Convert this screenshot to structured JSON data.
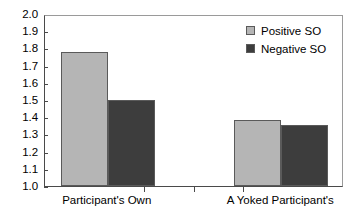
{
  "chart_data": {
    "type": "bar",
    "title": "",
    "xlabel": "",
    "ylabel": "",
    "categories": [
      "Participant's Own",
      "A Yoked Participant's"
    ],
    "series": [
      {
        "name": "Positive SO",
        "values": [
          1.78,
          1.385
        ],
        "color": "#b5b5b5"
      },
      {
        "name": "Negative SO",
        "values": [
          1.5,
          1.355
        ],
        "color": "#3d3d3d"
      }
    ],
    "ylim": [
      1.0,
      2.0
    ],
    "ytick_labels": [
      "2.0",
      "1.9",
      "1.8",
      "1.7",
      "1.6",
      "1.5",
      "1.4",
      "1.3",
      "1.2",
      "1.1",
      "1.0"
    ],
    "ytick_values": [
      2.0,
      1.9,
      1.8,
      1.7,
      1.6,
      1.5,
      1.4,
      1.3,
      1.2,
      1.1,
      1.0
    ],
    "grid": false,
    "legend_position": "upper right"
  },
  "legend": {
    "entries": [
      {
        "label": "Positive SO",
        "color": "#b5b5b5"
      },
      {
        "label": "Negative SO",
        "color": "#3d3d3d"
      }
    ]
  },
  "colors": {
    "positive_so": "#b5b5b5",
    "negative_so": "#3d3d3d",
    "axis": "#4a4a4a",
    "background": "#ffffff"
  }
}
